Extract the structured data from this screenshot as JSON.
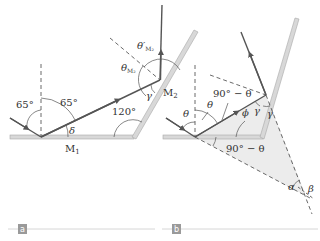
{
  "figure": {
    "panels": [
      {
        "id": "a",
        "tag": "a",
        "labels": {
          "incident_angle": "65°",
          "reflected_angle": "65°",
          "delta": "δ",
          "mirror_1": "M",
          "mirror_1_sub": "1",
          "mirror_2": "M",
          "mirror_2_sub": "2",
          "angle_between_mirrors": "120°",
          "gamma": "γ",
          "theta_m2": "θ",
          "theta_m2_sub": "M₂",
          "theta_prime_m2": "θ′",
          "theta_prime_m2_sub": "M₂"
        }
      },
      {
        "id": "b",
        "tag": "b",
        "labels": {
          "theta_left": "θ",
          "theta_right": "θ",
          "ninety_minus_theta_top": "90° − θ",
          "ninety_minus_theta_bottom": "90° − θ",
          "phi": "ϕ",
          "gamma_1": "γ",
          "gamma_2": "γ",
          "alpha": "α",
          "beta": "β"
        }
      }
    ],
    "colors": {
      "ray": "#555555",
      "mirror_fill": "#d8d8d8",
      "mirror_edge": "#a8a8a8",
      "dashed": "#444444",
      "shade": "#ececec",
      "tag_bg": "#9a9a9a",
      "rule": "#d6d6d6"
    }
  }
}
